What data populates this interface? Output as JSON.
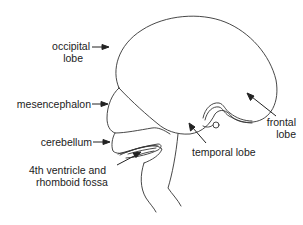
{
  "diagram": {
    "colors": {
      "line": "#333333",
      "text": "#222222",
      "background": "#ffffff"
    },
    "labels": {
      "occipital_lobe": {
        "line1": "occipital",
        "line2": "lobe"
      },
      "mesencephalon": {
        "line1": "mesencephalon"
      },
      "cerebellum": {
        "line1": "cerebellum"
      },
      "fourth_ventricle": {
        "line1": "4th ventricle and",
        "line2": "rhomboid fossa"
      },
      "temporal_lobe": {
        "line1": "temporal lobe"
      },
      "frontal_lobe": {
        "line1": "frontal",
        "line2": "lobe"
      }
    }
  }
}
